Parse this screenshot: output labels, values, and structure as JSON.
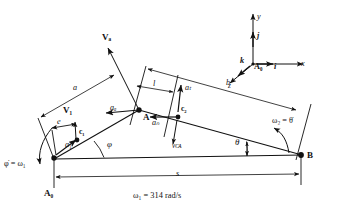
{
  "figure": {
    "kind": "kinematic-linkage-diagram",
    "caption": "ω₁ = 314 rad/s",
    "caption_symbol": "ω",
    "caption_sub": "1",
    "caption_value": "314",
    "caption_units": "rad/s",
    "background_color": "#ffffff",
    "ink_color": "#111111"
  },
  "points": {
    "A0_ground": "A₀",
    "A0_origin": "A₀",
    "A": "A",
    "B": "B",
    "c1": "c₁",
    "c2": "c₂"
  },
  "dimensions": {
    "a": "a",
    "b": "b",
    "e": "e",
    "l": "l",
    "s": "s"
  },
  "angles": {
    "phi": "φ",
    "theta": "θ"
  },
  "angular_velocities": {
    "omega1": "φ̇ = ω₁",
    "omega1_lhs": "φ̇",
    "omega1_rhs_symbol": "ω",
    "omega1_rhs_sub": "1",
    "omega2": "ω₂ = θ̇",
    "omega2_lhs_symbol": "ω",
    "omega2_lhs_sub": "2",
    "omega2_rhs": "θ̇"
  },
  "vectors": {
    "V_A": {
      "label": "Vₐ",
      "base": "V",
      "sub": "A",
      "kind": "velocity"
    },
    "V_1": {
      "label": "V₁",
      "base": "V",
      "sub": "1",
      "kind": "velocity"
    },
    "v_CA": {
      "label": "vᴄᴀ",
      "base": "v",
      "sub": "CA",
      "kind": "velocity"
    },
    "a_A": {
      "label": "aₐ",
      "base": "a",
      "sub": "A",
      "kind": "acceleration"
    },
    "a_1": {
      "label": "a₁",
      "base": "a",
      "sub": "1",
      "kind": "acceleration"
    },
    "a_n": {
      "label": "aₙ",
      "base": "a",
      "sub": "n",
      "kind": "acceleration"
    },
    "a_t": {
      "label": "aₜ",
      "base": "a",
      "sub": "t",
      "kind": "acceleration"
    }
  },
  "coordinate_triad": {
    "origin_label": "A₀",
    "axes": [
      {
        "name": "x-axis",
        "label": "x"
      },
      {
        "name": "y-axis",
        "label": "y"
      },
      {
        "name": "z-axis",
        "label": "z"
      }
    ],
    "unit_vectors": [
      {
        "name": "i-unit-vector",
        "label": "i"
      },
      {
        "name": "j-unit-vector",
        "label": "j"
      },
      {
        "name": "k-unit-vector",
        "label": "k"
      }
    ]
  }
}
